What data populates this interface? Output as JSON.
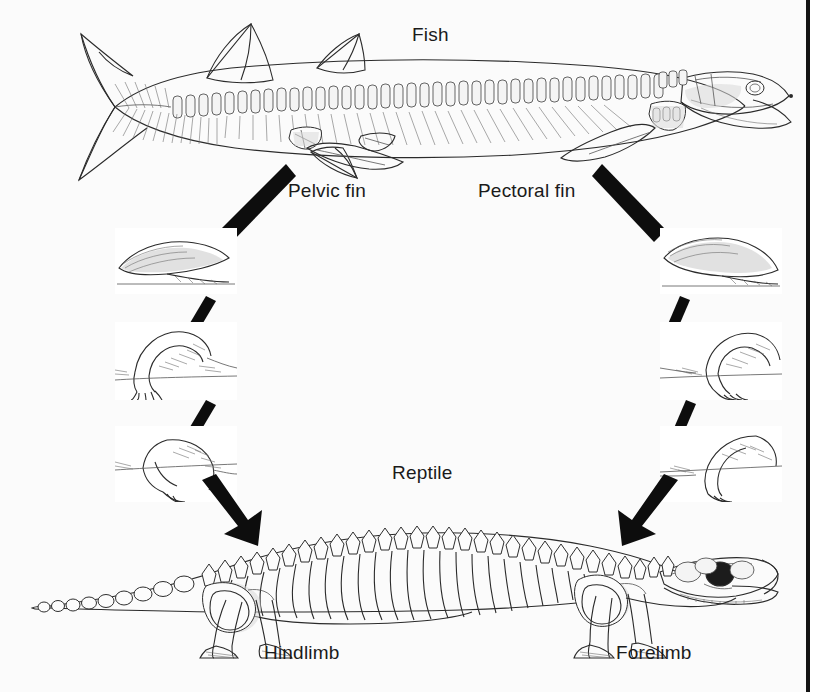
{
  "figure": {
    "background_color": "#fbfbfb",
    "ink_color": "#2b2b2b",
    "arrow_color": "#0d0d0d",
    "border_color": "#141414",
    "width": 825,
    "height": 692
  },
  "labels": {
    "fish": "Fish",
    "reptile": "Reptile",
    "pelvic_fin": "Pelvic fin",
    "pectoral_fin": "Pectoral fin",
    "hindlimb": "Hindlimb",
    "forelimb": "Forelimb"
  },
  "organisms": [
    {
      "name": "Fish",
      "position": "top",
      "description": "Lobe-finned fish skeleton in left-facing lateral view with caudal fin, dorsal fins, vertebral column, ribs, skull and paired fins",
      "features": [
        "Pelvic fin",
        "Pectoral fin"
      ]
    },
    {
      "name": "Reptile",
      "position": "bottom",
      "description": "Early reptile skeleton in right-facing lateral view with long tail, ribbed trunk, skull with large orbit, and sprawling limbs",
      "features": [
        "Hindlimb",
        "Forelimb"
      ]
    }
  ],
  "transition_columns": [
    {
      "side": "left",
      "from": "Pelvic fin",
      "to": "Hindlimb",
      "stages": [
        {
          "index": 1,
          "caption": "",
          "description": "broad paddle-like fin, shaded fin web"
        },
        {
          "index": 2,
          "caption": "",
          "description": "stout limb bent at elbow with short separate digits"
        },
        {
          "index": 3,
          "caption": "",
          "description": "elongated limb with defined upper and lower segments"
        }
      ]
    },
    {
      "side": "right",
      "from": "Pectoral fin",
      "to": "Forelimb",
      "stages": [
        {
          "index": 1,
          "caption": "",
          "description": "broad paddle-like fin, shaded fin web"
        },
        {
          "index": 2,
          "caption": "",
          "description": "stout limb bent at elbow with short separate digits"
        },
        {
          "index": 3,
          "caption": "",
          "description": "elongated limb with defined upper and lower segments"
        }
      ]
    }
  ],
  "connectors": [
    {
      "name": "pelvic-to-stage1",
      "shape": "thick-bar",
      "from": "Pelvic fin",
      "to": "left stage 1"
    },
    {
      "name": "left-stage1-to-stage2",
      "shape": "thick-bar",
      "from": "left stage 1",
      "to": "left stage 2"
    },
    {
      "name": "left-stage2-to-stage3",
      "shape": "thick-bar",
      "from": "left stage 2",
      "to": "left stage 3"
    },
    {
      "name": "left-stage3-to-hindlimb",
      "shape": "arrow",
      "from": "left stage 3",
      "to": "Hindlimb"
    },
    {
      "name": "pectoral-to-stage1",
      "shape": "thick-bar",
      "from": "Pectoral fin",
      "to": "right stage 1"
    },
    {
      "name": "right-stage1-to-stage2",
      "shape": "thick-bar",
      "from": "right stage 1",
      "to": "right stage 2"
    },
    {
      "name": "right-stage2-to-stage3",
      "shape": "thick-bar",
      "from": "right stage 2",
      "to": "right stage 3"
    },
    {
      "name": "right-stage3-to-forelimb",
      "shape": "arrow",
      "from": "right stage 3",
      "to": "Forelimb"
    }
  ]
}
